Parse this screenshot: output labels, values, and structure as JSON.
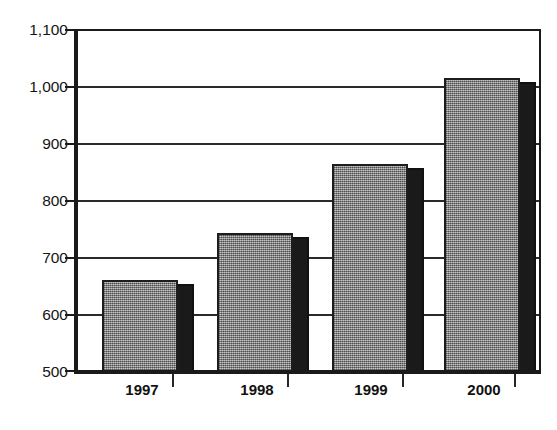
{
  "chart_data": {
    "type": "bar",
    "title": "",
    "title_note": "title is cropped off the top edge of the screenshot; only faint parenthesis fragments remain",
    "xlabel": "",
    "ylabel": "",
    "categories": [
      "1997",
      "1998",
      "1999",
      "2000"
    ],
    "values": [
      663,
      746,
      865,
      1014
    ],
    "series": [
      {
        "name": "",
        "values": [
          663,
          746,
          865,
          1014
        ]
      }
    ],
    "ylim": [
      500,
      1100
    ],
    "ytick_values": [
      1100,
      1000,
      900,
      800,
      700,
      600,
      500
    ],
    "ytick_labels": [
      "1,100",
      "1,000",
      "900",
      "800",
      "700",
      "600",
      "500"
    ],
    "grid": true,
    "grid_axis": "y",
    "legend": false,
    "legend_position": "none",
    "style": {
      "bar_face_color": "#9a9a9a",
      "bar_side_color": "#1a1a1a",
      "bar_outline_color": "#1d1d1d",
      "axis_color": "#1a1a1a",
      "grid_color": "#2a2a2a",
      "background_color": "#ffffff",
      "text_color": "#111111",
      "fill_pattern": "dithered-checkerboard",
      "three_d_effect": "right-side-black-shadow"
    }
  }
}
